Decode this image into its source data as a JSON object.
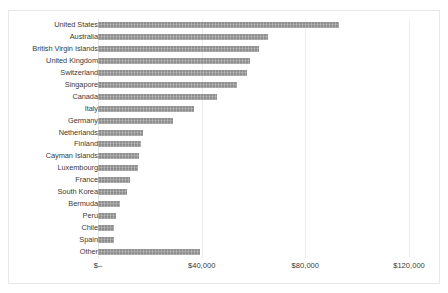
{
  "chart_data": {
    "type": "bar",
    "orientation": "horizontal",
    "title": "",
    "subtitle": "",
    "xlabel": "",
    "ylabel": "",
    "grid": true,
    "legend": false,
    "legend_position": "none",
    "bar_color": "#8f8f8f",
    "gridline_color": "#eceded",
    "xlim": [
      0,
      120000
    ],
    "xticks": [
      0,
      40000,
      80000,
      120000
    ],
    "xticklabels": [
      "$–",
      "$40,000",
      "$80,000",
      "$120,000"
    ],
    "categories": [
      "United States",
      "Australia",
      "British Virgin Islands",
      "United Kingdom",
      "Switzerland",
      "Singapore",
      "Canada",
      "Italy",
      "Germany",
      "Netherlands",
      "Finland",
      "Cayman Islands",
      "Luxembourg",
      "France",
      "South Korea",
      "Bermuda",
      "Peru",
      "Chile",
      "Spain",
      "Other"
    ],
    "values": [
      93000,
      65500,
      62000,
      58500,
      57500,
      53500,
      46000,
      37000,
      29000,
      17500,
      16500,
      16000,
      15500,
      12500,
      11000,
      8500,
      7000,
      6000,
      6200,
      39500
    ]
  }
}
